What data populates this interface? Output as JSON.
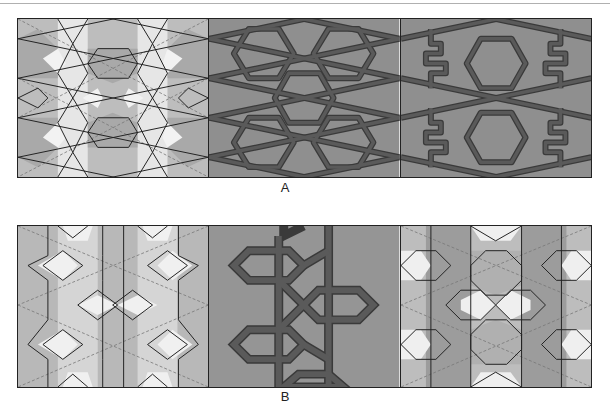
{
  "figure": {
    "rows": [
      {
        "label": "A",
        "panels": [
          {
            "name": "construction-tiling",
            "style": "polygonal tiling with dashed construction lines",
            "colors": {
              "light": "#e6e6e6",
              "mid": "#bdbdbd",
              "dark": "#a6a6a6",
              "line": "#222222",
              "dashed": "#777777"
            }
          },
          {
            "name": "interlaced-strapwork",
            "style": "interlaced band pattern",
            "colors": {
              "bg": "#8f8f8f",
              "band": "#555555",
              "band_edge": "#3a3a3a"
            }
          },
          {
            "name": "strapwork-with-fret-motifs",
            "style": "interlaced band pattern with fret (meander) motifs",
            "colors": {
              "bg": "#8f8f8f",
              "band": "#555555",
              "band_edge": "#3a3a3a"
            }
          }
        ]
      },
      {
        "label": "B",
        "panels": [
          {
            "name": "construction-tiling",
            "style": "hexagonal/octagonal tiling with dashed construction lines",
            "colors": {
              "light": "#ececec",
              "mid": "#c2c2c2",
              "dark": "#a8a8a8",
              "line": "#222222",
              "dashed": "#777777"
            }
          },
          {
            "name": "interlaced-strapwork",
            "style": "thick interlaced band pattern",
            "colors": {
              "bg": "#959595",
              "band": "#5a5a5a",
              "band_edge": "#3a3a3a"
            }
          },
          {
            "name": "colored-tiling-variant",
            "style": "polygonal tiling with dashed construction lines",
            "colors": {
              "light": "#ececec",
              "mid": "#bdbdbd",
              "dark": "#9c9c9c",
              "line": "#222222",
              "dashed": "#777777"
            }
          }
        ]
      }
    ]
  }
}
